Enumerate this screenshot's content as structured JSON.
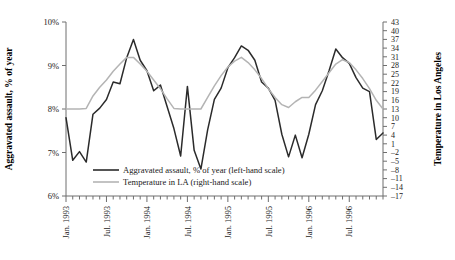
{
  "chart_data": {
    "type": "line",
    "title": "",
    "xlabel": "",
    "ylabel": "Aggravated assault, % of year",
    "ylabel_right": "Temperature in Los Angeles",
    "grid": false,
    "legend_position": "inside-bottom-left",
    "ylim": [
      6,
      10
    ],
    "ylim_right": [
      -17,
      43
    ],
    "yticks": [
      6,
      7,
      8,
      9,
      10
    ],
    "ytick_labels": [
      "6%",
      "7%",
      "8%",
      "9%",
      "10%"
    ],
    "yticks_right": [
      -17,
      -14,
      -11,
      -8,
      -5,
      -2,
      1,
      4,
      7,
      10,
      13,
      16,
      19,
      22,
      25,
      28,
      31,
      34,
      37,
      40,
      43
    ],
    "ytick_labels_right": [
      "–17",
      "–14",
      "–11",
      "–8",
      "–5",
      "–2",
      "1",
      "4",
      "7",
      "10",
      "13",
      "16",
      "19",
      "22",
      "25",
      "28",
      "31",
      "34",
      "37",
      "40",
      "43"
    ],
    "x": [
      "1993-01",
      "1993-02",
      "1993-03",
      "1993-04",
      "1993-05",
      "1993-06",
      "1993-07",
      "1993-08",
      "1993-09",
      "1993-10",
      "1993-11",
      "1993-12",
      "1994-01",
      "1994-02",
      "1994-03",
      "1994-04",
      "1994-05",
      "1994-06",
      "1994-07",
      "1994-08",
      "1994-09",
      "1994-10",
      "1994-11",
      "1994-12",
      "1995-01",
      "1995-02",
      "1995-03",
      "1995-04",
      "1995-05",
      "1995-06",
      "1995-07",
      "1995-08",
      "1995-09",
      "1995-10",
      "1995-11",
      "1995-12",
      "1996-01",
      "1996-02",
      "1996-03",
      "1996-04",
      "1996-05",
      "1996-06",
      "1996-07",
      "1996-08",
      "1996-09",
      "1996-10",
      "1996-11",
      "1996-12"
    ],
    "xtick_labels": [
      "Jan. 1993",
      "Jul. 1993",
      "Jan. 1994",
      "Jul. 1994",
      "Jan. 1995",
      "Jul. 1995",
      "Jan. 1996",
      "Jul. 1996"
    ],
    "xtick_indices": [
      0,
      6,
      12,
      18,
      24,
      30,
      36,
      42
    ],
    "series": [
      {
        "name": "Aggravated assault, % of year (left-hand scale)",
        "axis": "left",
        "color": "#2b2b2b",
        "values": [
          7.8,
          6.82,
          7.02,
          6.78,
          7.88,
          8.02,
          8.22,
          8.62,
          8.58,
          9.18,
          9.6,
          9.12,
          8.88,
          8.42,
          8.55,
          8.05,
          7.55,
          6.92,
          8.52,
          7.05,
          6.62,
          7.52,
          8.22,
          8.48,
          8.95,
          9.18,
          9.45,
          9.35,
          9.12,
          8.62,
          8.48,
          8.2,
          7.42,
          6.9,
          7.4,
          6.88,
          7.42,
          8.1,
          8.42,
          8.88,
          9.38,
          9.18,
          9.05,
          8.72,
          8.48,
          8.4,
          7.3,
          7.45
        ]
      },
      {
        "name": "Temperature in LA (right-hand scale)",
        "axis": "right",
        "color": "#b4b4b4",
        "values": [
          13.0,
          13.0,
          13.0,
          13.2,
          17.5,
          20.5,
          23.0,
          26.0,
          28.5,
          30.8,
          30.8,
          28.5,
          26.0,
          23.0,
          20.0,
          16.5,
          13.2,
          13.0,
          13.0,
          13.0,
          13.0,
          17.0,
          21.0,
          24.5,
          27.5,
          29.5,
          30.8,
          29.0,
          26.5,
          23.5,
          20.0,
          17.0,
          14.5,
          13.5,
          15.5,
          17.0,
          17.0,
          19.5,
          22.5,
          25.5,
          28.5,
          30.0,
          29.0,
          26.5,
          23.5,
          20.0,
          16.0,
          13.0
        ]
      }
    ],
    "legend_entries": [
      {
        "label": "Aggravated assault, % of year (left-hand scale)",
        "color": "#2b2b2b"
      },
      {
        "label": "Temperature in LA (right-hand scale)",
        "color": "#b4b4b4"
      }
    ]
  }
}
